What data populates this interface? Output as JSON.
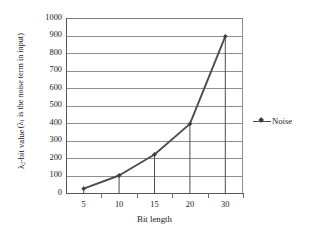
{
  "chart_data": {
    "type": "line",
    "title": "",
    "subtitle": "",
    "xlabel": "Bit length",
    "ylabel_line1": "λ₂-bit value",
    "ylabel_line2": "(λ₁ is the noise term in input)",
    "categories": [
      "5",
      "10",
      "15",
      "20",
      "30"
    ],
    "x": [
      5,
      10,
      15,
      20,
      30
    ],
    "series": [
      {
        "name": "Noise",
        "values": [
          25,
          100,
          220,
          395,
          895
        ],
        "color": "#4d4d4d",
        "marker": "diamond",
        "marker_color": "#3f3f3f"
      }
    ],
    "ylim": [
      0,
      1000
    ],
    "ytick_step": 100,
    "yticks": [
      1000,
      900,
      800,
      700,
      600,
      500,
      400,
      300,
      200,
      100,
      0
    ],
    "ytick_labels": [
      "1000",
      "900",
      "800",
      "700",
      "600",
      "500",
      "400",
      "300",
      "200",
      "100",
      "0"
    ],
    "grid": true,
    "grid_axis": "y",
    "grid_color": "#8f8f8f",
    "drop_lines": true,
    "legend": {
      "position": "right",
      "entries": [
        {
          "label": "Noise",
          "color": "#4d4d4d"
        }
      ]
    },
    "axis_color": "#555555",
    "background": "#ffffff"
  }
}
